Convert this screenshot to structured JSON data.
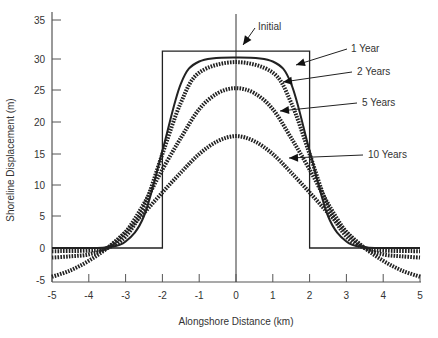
{
  "chart_data": {
    "type": "line",
    "title": "",
    "xlabel": "Alongshore Distance (km)",
    "ylabel": "Shoreline Displacement (m)",
    "xlim": [
      -5,
      5
    ],
    "ylim": [
      -5,
      35
    ],
    "x_ticks": [
      -5,
      -4,
      -3,
      -2,
      -1,
      0,
      1,
      2,
      3,
      4,
      5
    ],
    "y_ticks": [
      -5,
      0,
      5,
      10,
      15,
      20,
      25,
      30,
      35
    ],
    "grid": false,
    "legend": "annotations with arrows",
    "series": [
      {
        "name": "Initial",
        "style": "solid-thin",
        "x": [
          -5,
          -2,
          -2,
          2,
          2,
          5
        ],
        "y": [
          0,
          0,
          31,
          31,
          0,
          0
        ]
      },
      {
        "name": "1 Year",
        "style": "solid",
        "x": [
          -5,
          -4,
          -3.5,
          -3,
          -2.5,
          -2,
          -1.5,
          -1,
          0,
          1,
          1.5,
          2,
          2.5,
          3,
          3.5,
          4,
          5
        ],
        "y": [
          0,
          0,
          0.1,
          1,
          5,
          15.5,
          26,
          29.6,
          30.2,
          29.6,
          26,
          15.5,
          5,
          1,
          0.1,
          0,
          0
        ]
      },
      {
        "name": "2 Years",
        "style": "dashed-heavy",
        "x": [
          -5,
          -4,
          -3.5,
          -3,
          -2.5,
          -2,
          -1.5,
          -1,
          0,
          1,
          1.5,
          2,
          2.5,
          3,
          3.5,
          4,
          5
        ],
        "y": [
          -0.5,
          -0.4,
          0,
          1.8,
          6.5,
          15,
          23,
          27.8,
          29.5,
          27.8,
          23,
          15,
          6.5,
          1.8,
          0,
          -0.4,
          -0.5
        ]
      },
      {
        "name": "5 Years",
        "style": "dashed-heavy",
        "x": [
          -5,
          -4.5,
          -4,
          -3.5,
          -3,
          -2.5,
          -2,
          -1.5,
          -1,
          -0.5,
          0,
          0.5,
          1,
          1.5,
          2,
          2.5,
          3,
          3.5,
          4,
          4.5,
          5
        ],
        "y": [
          -1.5,
          -1.3,
          -1,
          0,
          2.5,
          7,
          12.5,
          17.5,
          22,
          24.5,
          25.3,
          24.5,
          22,
          17.5,
          12.5,
          7,
          2.5,
          0,
          -1,
          -1.3,
          -1.5
        ]
      },
      {
        "name": "10 Years",
        "style": "dashed-heavy",
        "x": [
          -5,
          -4.5,
          -4,
          -3.5,
          -3,
          -2.5,
          -2,
          -1.5,
          -1,
          -0.5,
          0,
          0.5,
          1,
          1.5,
          2,
          2.5,
          3,
          3.5,
          4,
          4.5,
          5
        ],
        "y": [
          -4.5,
          -3.5,
          -2,
          0,
          2.5,
          5.5,
          8.8,
          12,
          15,
          17,
          17.8,
          17,
          15,
          12,
          8.8,
          5.5,
          2.5,
          0,
          -2,
          -3.5,
          -4.5
        ]
      }
    ],
    "annotations": [
      {
        "text": "Initial",
        "x_px": 258,
        "y_px": 30
      },
      {
        "text": "1 Year",
        "x_px": 351,
        "y_px": 52
      },
      {
        "text": "2 Years",
        "x_px": 357,
        "y_px": 75
      },
      {
        "text": "5 Years",
        "x_px": 362,
        "y_px": 106
      },
      {
        "text": "10 Years",
        "x_px": 368,
        "y_px": 158
      }
    ]
  },
  "axes": {
    "xlabel": "Alongshore Distance (km)",
    "ylabel": "Shoreline Displacement (m)"
  }
}
